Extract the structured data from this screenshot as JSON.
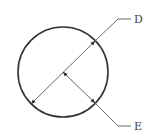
{
  "diagram": {
    "type": "circle-dimension",
    "colors": {
      "circle": "#333333",
      "line": "#666666",
      "text": "#444444"
    },
    "circle": {
      "cx": 63,
      "cy": 72,
      "r": 45
    },
    "labels": [
      {
        "id": "D",
        "text": "D",
        "meaning": "diameter"
      },
      {
        "id": "E",
        "text": "E",
        "meaning": "radius"
      }
    ]
  }
}
